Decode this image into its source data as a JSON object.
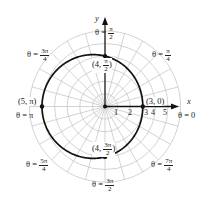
{
  "diagram": {
    "type": "polar-graph",
    "equation": "r = 4 - cos θ",
    "axes": {
      "x_label": "x",
      "y_label": "y"
    },
    "radial_ticks": [
      "1",
      "2",
      "3",
      "4",
      "5"
    ],
    "angle_labels": [
      {
        "theta": "θ = 0",
        "num": "",
        "den": ""
      },
      {
        "theta": "θ =",
        "num": "π",
        "den": "4"
      },
      {
        "theta": "θ =",
        "num": "π",
        "den": "2"
      },
      {
        "theta": "θ =",
        "num": "3π",
        "den": "4"
      },
      {
        "theta": "θ = π",
        "num": "",
        "den": ""
      },
      {
        "theta": "θ =",
        "num": "5π",
        "den": "4"
      },
      {
        "theta": "θ =",
        "num": "3π",
        "den": "2"
      },
      {
        "theta": "θ =",
        "num": "7π",
        "den": "4"
      }
    ],
    "points": [
      {
        "label": "(3, 0)",
        "r": 3,
        "theta": "0"
      },
      {
        "label_pre": "(4, ",
        "num": "π",
        "den": "2",
        "label_post": ")",
        "r": 4,
        "theta": "π/2"
      },
      {
        "label": "(5, π)",
        "r": 5,
        "theta": "π"
      },
      {
        "label_pre": "(4, ",
        "num": "3π",
        "den": "2",
        "label_post": ")",
        "r": 4,
        "theta": "3π/2"
      }
    ],
    "colors": {
      "grid": "#c8c8c8",
      "curve": "#111111",
      "axis": "#111111"
    }
  },
  "chart_data": {
    "type": "line",
    "title": "",
    "coordinate_system": "polar",
    "equation": "r = 4 - cos(theta)",
    "series": [
      {
        "name": "r = 4 - cos θ",
        "theta": [
          "0",
          "π/2",
          "π",
          "3π/2"
        ],
        "r": [
          3,
          4,
          5,
          4
        ]
      }
    ],
    "radial_ticks": [
      1,
      2,
      3,
      4,
      5
    ],
    "rlim": [
      0,
      6
    ],
    "angle_gridlines_step": "π/12",
    "angle_labels": [
      "0",
      "π/4",
      "π/2",
      "3π/4",
      "π",
      "5π/4",
      "3π/2",
      "7π/4"
    ],
    "xlabel": "x",
    "ylabel": "y",
    "grid": true
  }
}
